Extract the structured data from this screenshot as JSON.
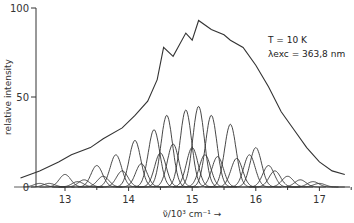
{
  "chart_data": {
    "type": "line",
    "title": "",
    "xlabel": "ν̃/10³ cm⁻¹ →",
    "ylabel": "relative intensity",
    "xlim": [
      12.3,
      17.5
    ],
    "ylim": [
      0,
      100
    ],
    "x_ticks": [
      13,
      14,
      15,
      16,
      17
    ],
    "y_ticks": [
      0,
      50,
      100
    ],
    "grid": false,
    "legend": null,
    "annotations": [
      {
        "text": "T = 10 K",
        "x": 16.2,
        "y": 84
      },
      {
        "text": "λexc = 363,8 nm",
        "x": 16.2,
        "y": 77
      }
    ],
    "series": [
      {
        "name": "envelope",
        "x": [
          12.3,
          12.6,
          12.9,
          13.1,
          13.4,
          13.6,
          13.9,
          14.1,
          14.3,
          14.45,
          14.55,
          14.7,
          14.9,
          15.0,
          15.1,
          15.3,
          15.5,
          15.6,
          15.8,
          16.0,
          16.2,
          16.4,
          16.6,
          16.8,
          17.0,
          17.2,
          17.4
        ],
        "values": [
          5,
          9,
          14,
          18,
          22,
          27,
          33,
          40,
          48,
          60,
          78,
          73,
          86,
          82,
          93,
          88,
          85,
          82,
          78,
          68,
          56,
          42,
          32,
          22,
          14,
          9,
          7
        ]
      },
      {
        "name": "component peaks",
        "centers": [
          12.6,
          12.75,
          13.0,
          13.2,
          13.3,
          13.5,
          13.6,
          13.8,
          13.9,
          14.1,
          14.2,
          14.4,
          14.5,
          14.6,
          14.7,
          14.9,
          15.0,
          15.1,
          15.2,
          15.3,
          15.4,
          15.6,
          15.7,
          15.9,
          16.0,
          16.2,
          16.3,
          16.5,
          16.7,
          16.9,
          17.0
        ],
        "heights": [
          2,
          2,
          7,
          3,
          4,
          12,
          6,
          18,
          9,
          26,
          13,
          32,
          19,
          40,
          24,
          43,
          22,
          45,
          18,
          40,
          17,
          35,
          16,
          18,
          22,
          12,
          9,
          6,
          4,
          3,
          2
        ]
      }
    ]
  }
}
